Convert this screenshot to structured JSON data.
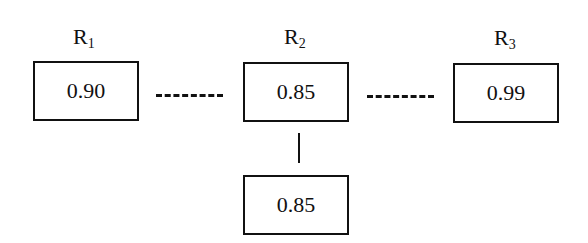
{
  "diagram": {
    "type": "reliability-block-diagram",
    "nodes": [
      {
        "id": "R1",
        "label_main": "R",
        "label_sub": "1",
        "value": "0.90"
      },
      {
        "id": "R2",
        "label_main": "R",
        "label_sub": "2",
        "value": "0.85"
      },
      {
        "id": "R3",
        "label_main": "R",
        "label_sub": "3",
        "value": "0.99"
      },
      {
        "id": "R2b",
        "label_main": "",
        "label_sub": "",
        "value": "0.85"
      }
    ],
    "edges": [
      {
        "from": "R1",
        "to": "R2",
        "style": "dashed"
      },
      {
        "from": "R2",
        "to": "R3",
        "style": "dashed"
      },
      {
        "from": "R2",
        "to": "R2b",
        "style": "solid"
      }
    ]
  }
}
